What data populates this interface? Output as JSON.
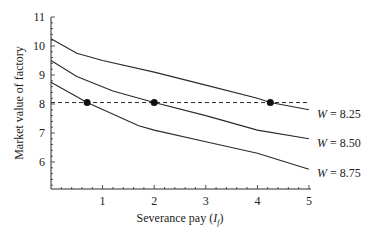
{
  "chart_data": {
    "type": "line",
    "title": "",
    "xlabel": "Severance pay (I_f)",
    "xlabel_main": "Severance pay (",
    "xlabel_var": "I",
    "xlabel_sub": "f",
    "xlabel_close": ")",
    "ylabel": "Market value of factory",
    "xlim": [
      0,
      5
    ],
    "ylim": [
      5.07,
      11
    ],
    "x_ticks": [
      1,
      2,
      3,
      4,
      5
    ],
    "y_ticks": [
      6,
      7,
      8,
      9,
      10,
      11
    ],
    "grid": false,
    "legend_position": "inline-right",
    "series": [
      {
        "name": "W = 8.25",
        "label_var": "W",
        "label_value": "= 8.25",
        "x": [
          0,
          0.5,
          1,
          2,
          3,
          4,
          4.25,
          5
        ],
        "values": [
          10.25,
          9.75,
          9.5,
          9.1,
          8.65,
          8.2,
          8.05,
          7.8
        ]
      },
      {
        "name": "W = 8.50",
        "label_var": "W",
        "label_value": "= 8.50",
        "x": [
          0,
          0.5,
          1.2,
          2,
          3,
          4,
          5
        ],
        "values": [
          9.5,
          8.95,
          8.45,
          8.05,
          7.6,
          7.1,
          6.8
        ]
      },
      {
        "name": "W = 8.75",
        "label_var": "W",
        "label_value": "= 8.75",
        "x": [
          0,
          0.7,
          1.7,
          2,
          3,
          4,
          5
        ],
        "values": [
          8.75,
          8.05,
          7.25,
          7.1,
          6.7,
          6.3,
          5.75
        ]
      }
    ],
    "reference_line": {
      "y": 8.05,
      "style": "dashed",
      "x_range": [
        0,
        5
      ]
    },
    "markers": [
      {
        "x": 0.7,
        "y": 8.05
      },
      {
        "x": 2.0,
        "y": 8.05
      },
      {
        "x": 4.25,
        "y": 8.05
      }
    ]
  }
}
